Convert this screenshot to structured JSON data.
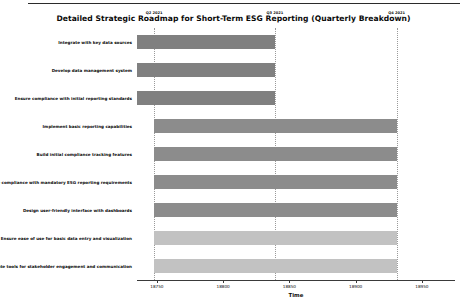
{
  "chart_data": {
    "type": "bar",
    "orientation": "horizontal",
    "title": "Detailed Strategic Roadmap for Short-Term ESG Reporting (Quarterly Breakdown)",
    "xlabel": "Time",
    "ylabel": "",
    "grid": true,
    "grid_axis": "x",
    "legend": "none",
    "xlim": [
      18735,
      18975
    ],
    "xticks": [
      18750,
      18800,
      18850,
      18900,
      18950
    ],
    "xticklabels": [
      "18750",
      "18800",
      "18850",
      "18900",
      "18950"
    ],
    "quarter_markers": [
      {
        "label": "Q2 2021",
        "value": 18748
      },
      {
        "label": "Q3 2021",
        "value": 18839
      },
      {
        "label": "Q4 2021",
        "value": 18931
      }
    ],
    "categories": [
      "Integrate with key data sources",
      "Develop data management system",
      "Ensure compliance with initial reporting standards",
      "Implement basic reporting capabilities",
      "Build initial compliance tracking features",
      "Ensure compliance with mandatory ESG reporting requirements",
      "Design user-friendly interface with dashboards",
      "Ensure ease of use for basic data entry and visualization",
      "Create tools for stakeholder engagement and communication"
    ],
    "bars": [
      {
        "task": "Integrate with key data sources",
        "start": 18735,
        "end": 18839,
        "color": "#808080"
      },
      {
        "task": "Develop data management system",
        "start": 18735,
        "end": 18839,
        "color": "#808080"
      },
      {
        "task": "Ensure compliance with initial reporting standards",
        "start": 18735,
        "end": 18839,
        "color": "#808080"
      },
      {
        "task": "Implement basic reporting capabilities",
        "start": 18748,
        "end": 18931,
        "color": "#8c8c8c"
      },
      {
        "task": "Build initial compliance tracking features",
        "start": 18748,
        "end": 18931,
        "color": "#8c8c8c"
      },
      {
        "task": "Ensure compliance with mandatory ESG reporting requirements",
        "start": 18748,
        "end": 18931,
        "color": "#8c8c8c"
      },
      {
        "task": "Design user-friendly interface with dashboards",
        "start": 18748,
        "end": 18931,
        "color": "#8c8c8c"
      },
      {
        "task": "Ensure ease of use for basic data entry and visualization",
        "start": 18748,
        "end": 18931,
        "color": "#c2c2c2"
      },
      {
        "task": "Create tools for stakeholder engagement and communication",
        "start": 18748,
        "end": 18931,
        "color": "#c2c2c2"
      }
    ]
  }
}
